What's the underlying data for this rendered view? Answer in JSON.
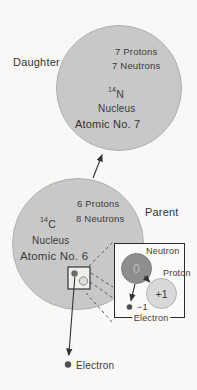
{
  "diagram_title": "Beta decay of Carbon-14 to Nitrogen-14",
  "daughter": {
    "label": "Daughter",
    "protons": "7 Protons",
    "neutrons": "7 Neutrons",
    "isotope_mass": "14",
    "isotope_symbol": "N",
    "nucleus_label": "Nucleus",
    "atomic_label": "Atomic No. 7"
  },
  "parent": {
    "label": "Parent",
    "protons": "6 Protons",
    "neutrons": "8 Neutrons",
    "isotope_mass": "14",
    "isotope_symbol": "C",
    "nucleus_label": "Nucleus",
    "atomic_label": "Atomic No. 6"
  },
  "inset": {
    "neutron_label": "Neutron",
    "neutron_charge": "0",
    "proton_label": "Proton",
    "proton_charge": "+1",
    "electron_charge": "−1",
    "electron_label": "Electron"
  },
  "emitted": {
    "electron_label": "Electron"
  },
  "colors": {
    "nucleus_fill": "#c8c8c8",
    "neutron_fill": "#8e8e8e",
    "proton_fill": "#d9d9d9",
    "background": "#f9f8f6",
    "line": "#333333"
  }
}
